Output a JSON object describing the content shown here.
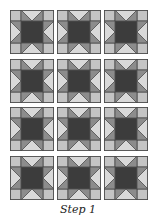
{
  "diagram": {
    "type": "quilt-block-layout",
    "block_name": "sawtooth-star",
    "rows": 4,
    "columns": 3,
    "colors": {
      "corner": "#c4c4c4",
      "goose_center": "#d9d9d9",
      "star_point": "#8c8c8c",
      "center": "#3c3c3c",
      "outline": "#4a4a4a"
    },
    "col_x": [
      10,
      57,
      104
    ],
    "row_y": [
      10,
      59,
      107,
      156
    ]
  },
  "caption": "Step 1"
}
